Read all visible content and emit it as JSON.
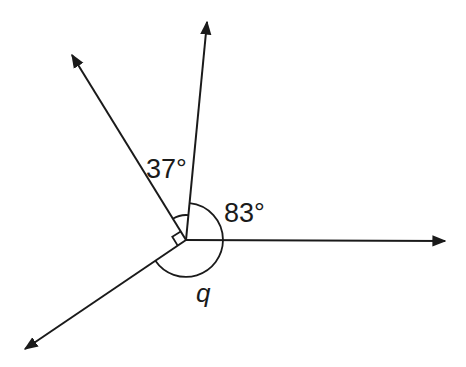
{
  "diagram": {
    "type": "angles-at-a-point",
    "center": [
      186,
      240
    ],
    "rays": [
      {
        "name": "ray-right",
        "end": [
          445,
          241
        ]
      },
      {
        "name": "ray-top",
        "end": [
          207,
          22
        ]
      },
      {
        "name": "ray-upper-left",
        "end": [
          72,
          55
        ]
      },
      {
        "name": "ray-lower-left",
        "end": [
          25,
          349
        ]
      }
    ],
    "angles": [
      {
        "name": "angle-37",
        "label": "37°",
        "between": [
          "ray-upper-left",
          "ray-top"
        ]
      },
      {
        "name": "angle-83",
        "label": "83°",
        "between": [
          "ray-top",
          "ray-right"
        ]
      },
      {
        "name": "angle-right",
        "label": "",
        "between": [
          "ray-lower-left",
          "ray-upper-left"
        ],
        "marker": "right-angle"
      },
      {
        "name": "angle-q",
        "label": "q",
        "between": [
          "ray-right",
          "ray-lower-left"
        ]
      }
    ],
    "line_color": "#1a1a1a"
  }
}
